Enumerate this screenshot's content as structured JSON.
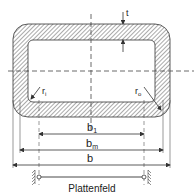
{
  "diagram": {
    "labels": {
      "thickness": "t",
      "inner_radius": "r",
      "inner_radius_sub": "i",
      "outer_radius": "r",
      "outer_radius_sub": "o",
      "b1": "b",
      "b1_sub": "1",
      "bm": "b",
      "bm_sub": "m",
      "b": "b",
      "plate_field": "Plattenfeld"
    },
    "colors": {
      "line": "#333333",
      "hatch": "#555555",
      "background": "#ffffff"
    }
  }
}
